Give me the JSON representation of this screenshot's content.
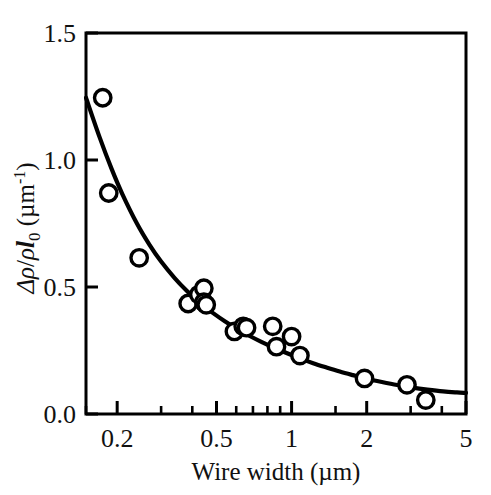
{
  "figure": {
    "background_color": "#ffffff",
    "ink_color": "#000000"
  },
  "chart_data": {
    "type": "scatter",
    "title": "",
    "xlabel": "Wire width (µm)",
    "ylabel": "Δρ/ρl₀ (µm⁻¹)",
    "ylabel_parts": {
      "delta": "Δ",
      "rho1": "ρ",
      "slash": "/",
      "rho2": "ρ",
      "ell": "l",
      "ell_subscript": "0",
      "unit_open": " (µm",
      "unit_exponent": "-1",
      "unit_close": ")"
    },
    "xscale": "log",
    "yscale": "linear",
    "xlim": [
      0.15,
      5
    ],
    "ylim": [
      0.0,
      1.5
    ],
    "grid": false,
    "legend": null,
    "xticks": [
      0.2,
      0.5,
      1,
      2,
      5
    ],
    "xtick_labels": [
      "0.2",
      "0.5",
      "1",
      "2",
      "5"
    ],
    "xminor_ticks": [
      0.15,
      0.3,
      0.4,
      0.6,
      0.7,
      0.8,
      0.9,
      1.5,
      3,
      4
    ],
    "yticks": [
      0.0,
      0.5,
      1.0,
      1.5
    ],
    "ytick_labels": [
      "0.0",
      "0.5",
      "1.0",
      "1.5"
    ],
    "marker": "open-circle",
    "points": [
      {
        "x": 0.175,
        "y": 1.245
      },
      {
        "x": 0.185,
        "y": 0.87
      },
      {
        "x": 0.245,
        "y": 0.615
      },
      {
        "x": 0.385,
        "y": 0.435
      },
      {
        "x": 0.425,
        "y": 0.47
      },
      {
        "x": 0.445,
        "y": 0.495
      },
      {
        "x": 0.445,
        "y": 0.44
      },
      {
        "x": 0.455,
        "y": 0.43
      },
      {
        "x": 0.59,
        "y": 0.325
      },
      {
        "x": 0.64,
        "y": 0.345
      },
      {
        "x": 0.66,
        "y": 0.34
      },
      {
        "x": 0.84,
        "y": 0.345
      },
      {
        "x": 0.87,
        "y": 0.265
      },
      {
        "x": 1.0,
        "y": 0.305
      },
      {
        "x": 1.08,
        "y": 0.23
      },
      {
        "x": 1.96,
        "y": 0.14
      },
      {
        "x": 2.9,
        "y": 0.115
      },
      {
        "x": 3.45,
        "y": 0.055
      }
    ],
    "fit_curve": {
      "description": "monotonically decreasing fit through the data",
      "x": [
        0.15,
        0.17,
        0.19,
        0.21,
        0.24,
        0.27,
        0.3,
        0.34,
        0.38,
        0.43,
        0.48,
        0.54,
        0.6,
        0.68,
        0.76,
        0.86,
        0.96,
        1.08,
        1.22,
        1.38,
        1.56,
        1.76,
        2.0,
        2.3,
        2.65,
        3.05,
        3.5,
        4.05,
        4.6,
        5.0
      ],
      "y": [
        1.245,
        1.09,
        0.965,
        0.865,
        0.75,
        0.665,
        0.6,
        0.535,
        0.485,
        0.435,
        0.4,
        0.365,
        0.337,
        0.307,
        0.283,
        0.259,
        0.239,
        0.219,
        0.2,
        0.183,
        0.167,
        0.153,
        0.139,
        0.126,
        0.114,
        0.104,
        0.096,
        0.089,
        0.085,
        0.083
      ]
    }
  }
}
